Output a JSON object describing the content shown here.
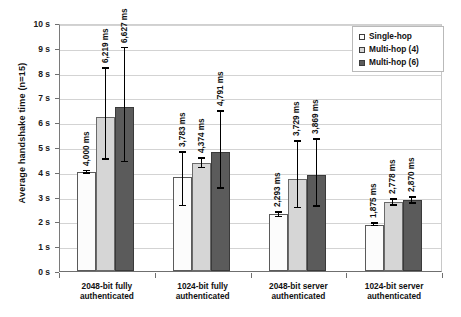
{
  "chart_data": {
    "type": "bar",
    "title": "",
    "xlabel": "",
    "ylabel": "Average handshake time (n=15)",
    "ylim": [
      0,
      10
    ],
    "yunit": "s",
    "grid": true,
    "legend_position": "top-right",
    "value_unit": "ms",
    "categories": [
      "2048-bit fully authenticated",
      "1024-bit fully authenticated",
      "2048-bit server authenticated",
      "1024-bit server authenticated"
    ],
    "yticks": [
      "0 s",
      "1 s",
      "2 s",
      "3 s",
      "4 s",
      "5 s",
      "6 s",
      "7 s",
      "8 s",
      "9 s",
      "10 s"
    ],
    "ytick_values": [
      0,
      1,
      2,
      3,
      4,
      5,
      6,
      7,
      8,
      9,
      10
    ],
    "series": [
      {
        "name": "Single-hop",
        "color": "#fcfcfc",
        "values": [
          4000,
          3783,
          2293,
          1875
        ],
        "labels": [
          "4,000 ms",
          "3,783 ms",
          "2,293 ms",
          "1,875 ms"
        ],
        "err_low": [
          3950,
          2650,
          2200,
          1830
        ],
        "err_high": [
          4050,
          4800,
          2390,
          1925
        ]
      },
      {
        "name": "Multi-hop (4)",
        "color": "#d6d6d6",
        "values": [
          6219,
          4374,
          3729,
          2778
        ],
        "labels": [
          "6,219 ms",
          "4,374 ms",
          "3,729 ms",
          "2,778 ms"
        ],
        "err_low": [
          4520,
          4180,
          2560,
          2660
        ],
        "err_high": [
          8180,
          4560,
          5250,
          2900
        ]
      },
      {
        "name": "Multi-hop (6)",
        "color": "#5b5b5b",
        "values": [
          6627,
          4791,
          3869,
          2870
        ],
        "labels": [
          "6,627 ms",
          "4,791 ms",
          "3,869 ms",
          "2,870 ms"
        ],
        "err_low": [
          4420,
          3340,
          2620,
          2750
        ],
        "err_high": [
          9010,
          6460,
          5320,
          2990
        ]
      }
    ]
  },
  "legend": {
    "items": [
      {
        "label": "Single-hop",
        "color": "#fcfcfc"
      },
      {
        "label": "Multi-hop (4)",
        "color": "#d6d6d6"
      },
      {
        "label": "Multi-hop (6)",
        "color": "#5b5b5b"
      }
    ]
  }
}
